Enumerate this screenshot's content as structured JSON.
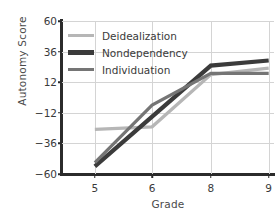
{
  "chart_data": {
    "type": "line",
    "title": "",
    "xlabel": "Grade",
    "ylabel": "Autonomy Score",
    "categories": [
      "5",
      "6",
      "8",
      "9"
    ],
    "x_tick_labels": [
      "5",
      "6",
      "8",
      "9"
    ],
    "y_tick_labels": [
      "60",
      "36",
      "12",
      "−12",
      "−36",
      "−60"
    ],
    "y_tick_values": [
      60,
      36,
      12,
      -12,
      -36,
      -60
    ],
    "ylim": [
      -60,
      60
    ],
    "grid": true,
    "legend_position": "top-left",
    "series": [
      {
        "name": "Deidealization",
        "color": "#b6b6b6",
        "width": 3.2,
        "values": [
          -25,
          -23,
          18,
          23
        ]
      },
      {
        "name": "Nondependency",
        "color": "#3b3b3b",
        "width": 4.2,
        "values": [
          -54,
          -15,
          25,
          29
        ]
      },
      {
        "name": "Individuation",
        "color": "#757575",
        "width": 3.2,
        "values": [
          -51,
          -6,
          19,
          19
        ]
      }
    ]
  },
  "axes": {
    "y_title": "Autonomy Score",
    "x_title": "Grade"
  },
  "colors": {
    "axis": "#2b2b2b",
    "grid": "#d4d4d4",
    "text": "#3a3a3a",
    "background": "#ffffff"
  }
}
